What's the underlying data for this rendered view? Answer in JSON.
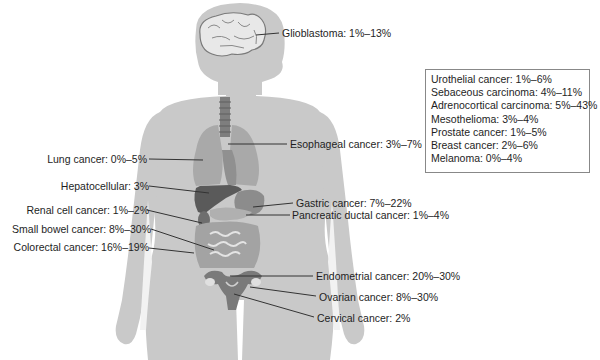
{
  "diagram": {
    "type": "anatomical-annotation",
    "colors": {
      "silhouette": "#c8c8c8",
      "brain": "#e6e6e6",
      "lungs": "#a6a6a6",
      "liver": "#5c5c5c",
      "stomach": "#8a8a8a",
      "intestines": "#a0a0a0",
      "uterus": "#7a7a7a",
      "leader_line": "#333333"
    }
  },
  "labels": {
    "glioblastoma": "Glioblastoma: 1%–13%",
    "esophageal": "Esophageal cancer: 3%–7%",
    "lung": "Lung cancer: 0%–5%",
    "hepatocellular": "Hepatocellular: 3%",
    "gastric": "Gastric cancer: 7%–22%",
    "pancreatic": "Pancreatic ductal cancer: 1%–4%",
    "renal": "Renal cell cancer: 1%–2%",
    "small_bowel": "Small bowel cancer: 8%–30%",
    "colorectal": "Colorectal cancer: 16%–19%",
    "endometrial": "Endometrial cancer: 20%–30%",
    "ovarian": "Ovarian cancer: 8%–30%",
    "cervical": "Cervical cancer: 2%"
  },
  "legend": {
    "items": [
      "Urothelial cancer: 1%–6%",
      "Sebaceous carcinoma: 4%–11%",
      "Adrenocortical carcinoma: 5%–43%",
      "Mesothelioma: 3%–4%",
      "Prostate cancer: 1%–5%",
      "Breast cancer: 2%–6%",
      "Melanoma: 0%–4%"
    ]
  }
}
